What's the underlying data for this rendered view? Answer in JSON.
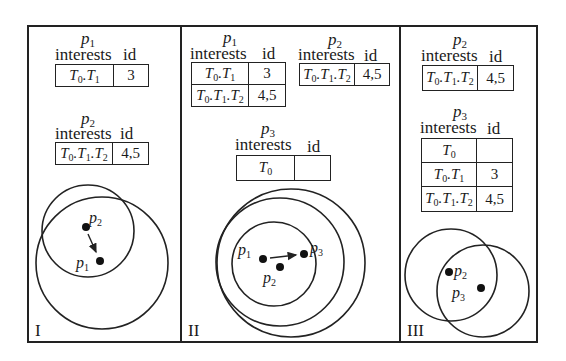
{
  "panels": [
    {
      "numeral": "I",
      "tables": [
        {
          "peer": "p",
          "peer_sub": "1",
          "header": {
            "interests": "interests",
            "id": "id"
          },
          "rows": [
            {
              "interest": [
                "T",
                "0",
                ".T",
                "1"
              ],
              "id": "3"
            }
          ]
        },
        {
          "peer": "p",
          "peer_sub": "2",
          "header": {
            "interests": "interests",
            "id": "id"
          },
          "rows": [
            {
              "interest": [
                "T",
                "0",
                ".T",
                "1",
                ".T",
                "2"
              ],
              "id": "4,5"
            }
          ]
        }
      ],
      "nodes": [
        {
          "label": "p",
          "sub": "2"
        },
        {
          "label": "p",
          "sub": "1"
        }
      ],
      "arrow": {
        "from": "p2",
        "to": "p1"
      }
    },
    {
      "numeral": "II",
      "tables": [
        {
          "peer": "p",
          "peer_sub": "1",
          "header": {
            "interests": "interests",
            "id": "id"
          },
          "rows": [
            {
              "interest": [
                "T",
                "0",
                ".T",
                "1"
              ],
              "id": "3"
            },
            {
              "interest": [
                "T",
                "0",
                ".T",
                "1",
                ".T",
                "2"
              ],
              "id": "4,5"
            }
          ]
        },
        {
          "peer": "p",
          "peer_sub": "2",
          "header": {
            "interests": "interests",
            "id": "id"
          },
          "rows": [
            {
              "interest": [
                "T",
                "0",
                ".T",
                "1",
                ".T",
                "2"
              ],
              "id": "4,5"
            }
          ]
        },
        {
          "peer": "p",
          "peer_sub": "3",
          "header": {
            "interests": "interests",
            "id": "id"
          },
          "rows": [
            {
              "interest": [
                "T",
                "0"
              ],
              "id": ""
            }
          ]
        }
      ],
      "nodes": [
        {
          "label": "p",
          "sub": "1"
        },
        {
          "label": "p",
          "sub": "2"
        },
        {
          "label": "p",
          "sub": "3"
        }
      ],
      "arrow": {
        "from": "p1",
        "to": "p3"
      }
    },
    {
      "numeral": "III",
      "tables": [
        {
          "peer": "p",
          "peer_sub": "2",
          "header": {
            "interests": "interests",
            "id": "id"
          },
          "rows": [
            {
              "interest": [
                "T",
                "0",
                ".T",
                "1",
                ".T",
                "2"
              ],
              "id": "4,5"
            }
          ]
        },
        {
          "peer": "p",
          "peer_sub": "3",
          "header": {
            "interests": "interests",
            "id": "id"
          },
          "rows": [
            {
              "interest": [
                "T",
                "0"
              ],
              "id": ""
            },
            {
              "interest": [
                "T",
                "0",
                ".T",
                "1"
              ],
              "id": "3"
            },
            {
              "interest": [
                "T",
                "0",
                ".T",
                "1",
                ".T",
                "2"
              ],
              "id": "4,5"
            }
          ]
        }
      ],
      "nodes": [
        {
          "label": "p",
          "sub": "2"
        },
        {
          "label": "p",
          "sub": "3"
        }
      ]
    }
  ],
  "colors": {
    "stroke": "#222222",
    "background": "#ffffff"
  }
}
